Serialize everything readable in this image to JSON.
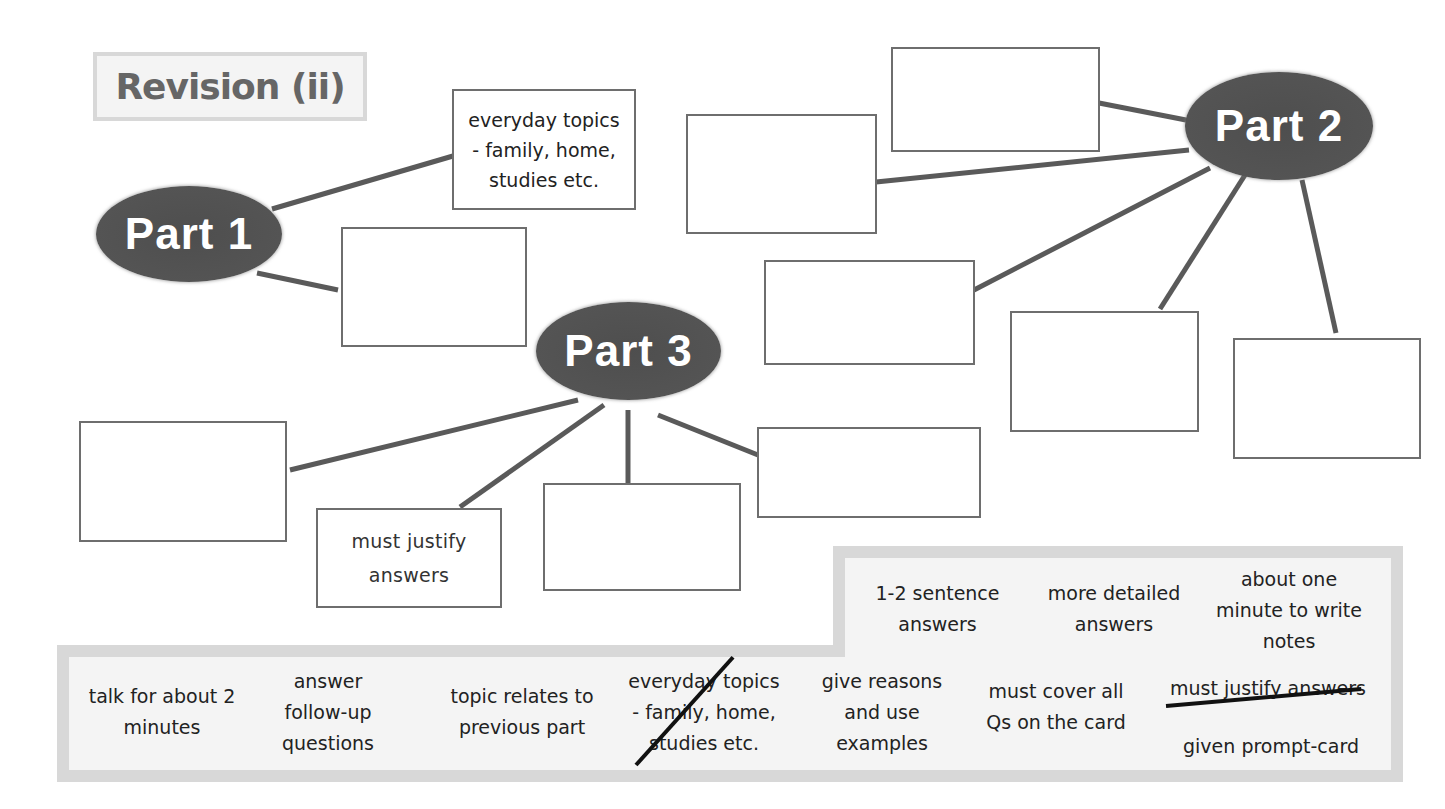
{
  "title": "Revision (ii)",
  "nodes": {
    "part1": {
      "label": "Part 1"
    },
    "part2": {
      "label": "Part 2"
    },
    "part3": {
      "label": "Part 3"
    }
  },
  "boxes": {
    "part1_a": "everyday topics\n- family, home,\nstudies etc.",
    "part1_b": "",
    "part2_a": "",
    "part2_b": "",
    "part2_c": "",
    "part2_d": "",
    "part2_e": "",
    "part3_a": "",
    "part3_b": "must justify\nanswers",
    "part3_c": "",
    "part3_d": ""
  },
  "word_bank": {
    "upper": [
      "1-2 sentence\nanswers",
      "more detailed\nanswers",
      "about one\nminute to write\nnotes"
    ],
    "lower": [
      "talk for about 2\nminutes",
      "answer\nfollow-up\nquestions",
      "topic relates to\nprevious part",
      "everyday topics\n- family, home,\nstudies etc.",
      "give reasons\nand use\nexamples",
      "must cover all\nQs on the card",
      "must justify answers",
      "given prompt-card"
    ],
    "crossed_out": [
      "everyday topics - family, home, studies etc.",
      "must justify answers"
    ]
  },
  "colors": {
    "oval": "#545454",
    "box_border": "#6e6e6e",
    "bank_border": "#d8d8d8",
    "bank_fill": "#f4f4f4",
    "title_text": "#666666"
  }
}
